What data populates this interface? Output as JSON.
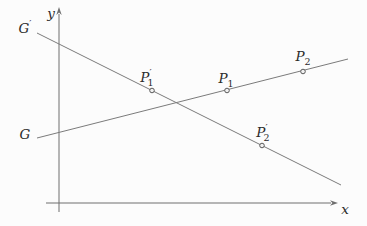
{
  "figure": {
    "background_color": "#fcfcfc",
    "line_color": "#7b7b7b",
    "axis_color": "#6e6e6e",
    "label_color": "#2b2b2b",
    "marker": {
      "radius": 2.3,
      "fill": "#f0f0f0",
      "stroke": "#5a5a5a"
    },
    "axes": {
      "x_axis": {
        "label": "x",
        "from": [
          46,
          203
        ],
        "to": [
          331,
          203
        ],
        "tip": [
          338,
          203
        ],
        "label_pos": [
          345,
          210
        ]
      },
      "y_axis": {
        "label": "y",
        "from": [
          59,
          212
        ],
        "to": [
          59,
          14
        ],
        "tip": [
          59,
          7
        ],
        "label_pos": [
          51,
          14
        ]
      }
    },
    "lines": [
      {
        "id": "line-g-prime",
        "label_base": "G",
        "label_prime": "′",
        "label_sub": "",
        "from": [
          37,
          33
        ],
        "to": [
          341,
          185
        ],
        "label_pos": [
          25,
          27
        ]
      },
      {
        "id": "line-g",
        "label_base": "G",
        "label_prime": "",
        "label_sub": "",
        "from": [
          37,
          138
        ],
        "to": [
          348,
          59
        ],
        "label_pos": [
          25,
          135
        ]
      }
    ],
    "points": [
      {
        "id": "point-p1-prime",
        "label_base": "P",
        "label_prime": "′",
        "label_sub": "1",
        "at": [
          152,
          90.5
        ],
        "label_pos": [
          147,
          78
        ]
      },
      {
        "id": "point-p1",
        "label_base": "P",
        "label_prime": "",
        "label_sub": "1",
        "at": [
          227,
          90.5
        ],
        "label_pos": [
          226,
          80
        ]
      },
      {
        "id": "point-p2",
        "label_base": "P",
        "label_prime": "",
        "label_sub": "2",
        "at": [
          303,
          71.5
        ],
        "label_pos": [
          303,
          58
        ]
      },
      {
        "id": "point-p2-prime",
        "label_base": "P",
        "label_prime": "′",
        "label_sub": "2",
        "at": [
          262,
          145.5
        ],
        "label_pos": [
          263,
          133
        ]
      }
    ]
  }
}
